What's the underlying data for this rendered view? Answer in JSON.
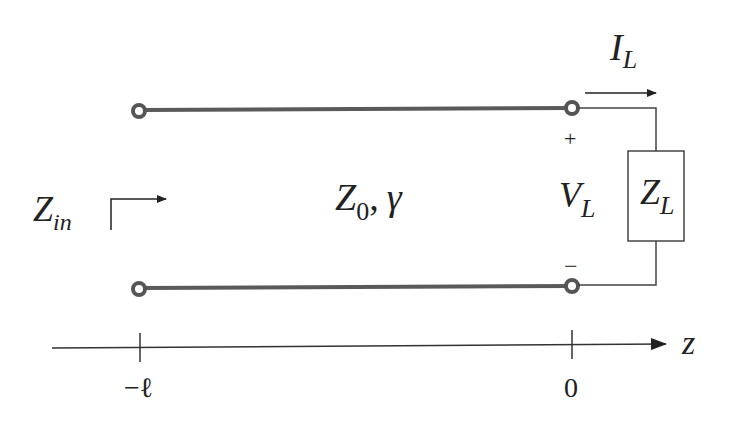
{
  "diagram": {
    "labels": {
      "z_in_main": "Z",
      "z_in_sub": "in",
      "line_z0_main": "Z",
      "line_z0_sub": "0",
      "line_sep": ",",
      "line_gamma": "γ",
      "i_l_main": "I",
      "i_l_sub": "L",
      "v_l_main": "V",
      "v_l_sub": "L",
      "plus": "+",
      "minus": "−",
      "z_l_main": "Z",
      "z_l_sub": "L",
      "axis_label": "z",
      "tick_left": "−ℓ",
      "tick_right": "0"
    },
    "colors": {
      "line": "#555555",
      "ink": "#222222",
      "background": "#ffffff"
    }
  }
}
